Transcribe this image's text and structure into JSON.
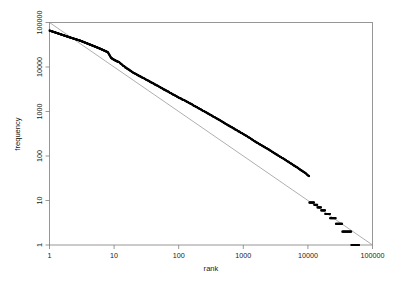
{
  "chart_data": {
    "type": "scatter",
    "title": "",
    "subtitle": "",
    "xlabel": "rank",
    "ylabel": "frequency",
    "xscale": "log",
    "yscale": "log",
    "xlim": [
      1,
      100000
    ],
    "ylim": [
      1,
      100000
    ],
    "grid": false,
    "legend": null,
    "xticks": [
      "1",
      "10",
      "100",
      "1000",
      "10000",
      "100000"
    ],
    "xtick_values": [
      1,
      10,
      100,
      1000,
      10000,
      100000
    ],
    "yticks": [
      "1",
      "10",
      "100",
      "1000",
      "10000",
      "100000"
    ],
    "ytick_values": [
      1,
      10,
      100,
      1000,
      10000,
      100000
    ],
    "annotations": [],
    "series": [
      {
        "name": "frequency vs rank",
        "marker": "square",
        "color": "#000000",
        "description": "Empirical word-frequency distribution following Zipf's law; dense black band of points from rank 1 to about 60000, flattening into integer-frequency plateaus in the tail.",
        "points": [
          [
            1,
            66000
          ],
          [
            2,
            47000
          ],
          [
            3,
            39000
          ],
          [
            4,
            33000
          ],
          [
            5,
            29000
          ],
          [
            6,
            26000
          ],
          [
            7,
            23500
          ],
          [
            8,
            21500
          ],
          [
            9,
            16000
          ],
          [
            10,
            14500
          ],
          [
            11,
            13500
          ],
          [
            12,
            12800
          ],
          [
            13,
            11500
          ],
          [
            14,
            10500
          ],
          [
            15,
            9800
          ],
          [
            16,
            9200
          ],
          [
            17,
            8700
          ],
          [
            18,
            8200
          ],
          [
            19,
            7800
          ],
          [
            20,
            7400
          ],
          [
            25,
            6200
          ],
          [
            30,
            5400
          ],
          [
            35,
            4800
          ],
          [
            40,
            4300
          ],
          [
            50,
            3600
          ],
          [
            60,
            3100
          ],
          [
            70,
            2750
          ],
          [
            80,
            2450
          ],
          [
            90,
            2250
          ],
          [
            100,
            2050
          ],
          [
            120,
            1800
          ],
          [
            150,
            1520
          ],
          [
            200,
            1200
          ],
          [
            250,
            1000
          ],
          [
            300,
            860
          ],
          [
            400,
            680
          ],
          [
            500,
            560
          ],
          [
            600,
            480
          ],
          [
            700,
            420
          ],
          [
            800,
            375
          ],
          [
            900,
            340
          ],
          [
            1000,
            310
          ],
          [
            1200,
            265
          ],
          [
            1500,
            215
          ],
          [
            2000,
            168
          ],
          [
            2500,
            138
          ],
          [
            3000,
            117
          ],
          [
            4000,
            90
          ],
          [
            5000,
            74
          ],
          [
            6000,
            62
          ],
          [
            7000,
            54
          ],
          [
            8000,
            47
          ],
          [
            9000,
            42
          ],
          [
            10000,
            37
          ],
          [
            12000,
            30
          ],
          [
            15000,
            23
          ],
          [
            18000,
            19
          ],
          [
            20000,
            17
          ],
          [
            25000,
            13
          ],
          [
            30000,
            10
          ],
          [
            35000,
            8
          ],
          [
            40000,
            6
          ],
          [
            45000,
            5
          ],
          [
            50000,
            4
          ],
          [
            55000,
            3
          ],
          [
            60000,
            2
          ],
          [
            65000,
            1
          ]
        ],
        "tail_plateaus": [
          {
            "frequency": 9,
            "rank_start": 10500,
            "rank_end": 12500
          },
          {
            "frequency": 8,
            "rank_start": 12500,
            "rank_end": 14000
          },
          {
            "frequency": 7,
            "rank_start": 14000,
            "rank_end": 16000
          },
          {
            "frequency": 6,
            "rank_start": 16000,
            "rank_end": 18500
          },
          {
            "frequency": 5,
            "rank_start": 18500,
            "rank_end": 22000
          },
          {
            "frequency": 4,
            "rank_start": 22000,
            "rank_end": 27000
          },
          {
            "frequency": 3,
            "rank_start": 27000,
            "rank_end": 34000
          },
          {
            "frequency": 2,
            "rank_start": 34000,
            "rank_end": 47000
          },
          {
            "frequency": 1,
            "rank_start": 47000,
            "rank_end": 62000
          }
        ]
      },
      {
        "name": "power-law reference line",
        "marker": "none",
        "color": "#9a9a9a",
        "description": "Straight grey guide line on the log-log axes from (1, 100000) to (100000, 1); slope -1.",
        "points": [
          [
            1,
            100000
          ],
          [
            100000,
            1
          ]
        ]
      }
    ]
  }
}
